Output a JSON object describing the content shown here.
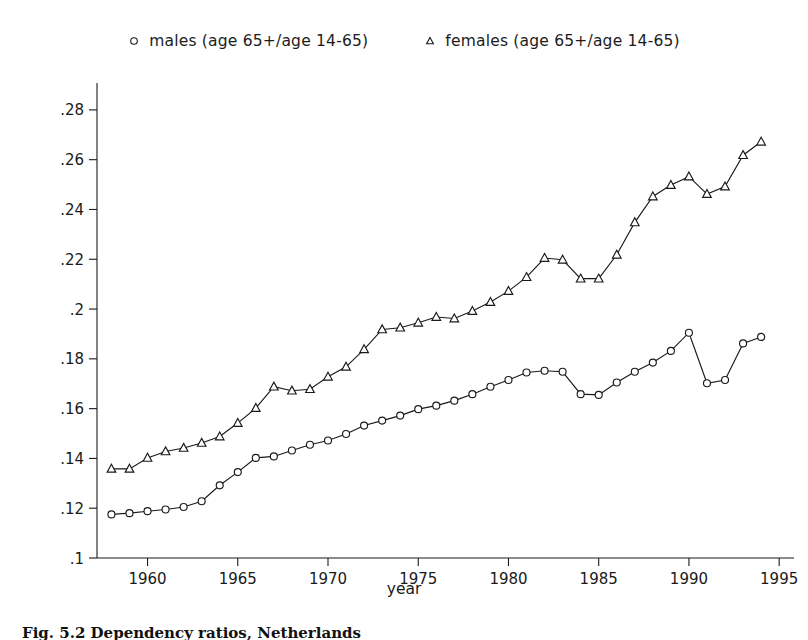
{
  "legend": {
    "entries": [
      {
        "marker": "circle-marker-icon",
        "label": "males  (age 65+/age 14-65)"
      },
      {
        "marker": "triangle-marker-icon",
        "label": "females  (age 65+/age 14-65)"
      }
    ]
  },
  "caption": {
    "text": "Fig. 5.2   Dependency ratios, Netherlands"
  },
  "chart_data": {
    "type": "line",
    "title": "",
    "xlabel": "year",
    "ylabel": "",
    "xlim": [
      1957.2,
      1995.6
    ],
    "ylim": [
      0.1,
      0.29
    ],
    "grid": false,
    "legend_position": "top",
    "xticks": [
      1960,
      1965,
      1970,
      1975,
      1980,
      1985,
      1990,
      1995
    ],
    "xticklabels": [
      "1960",
      "1965",
      "1970",
      "1975",
      "1980",
      "1985",
      "1990",
      "1995"
    ],
    "yticks": [
      0.1,
      0.12,
      0.14,
      0.16,
      0.18,
      0.2,
      0.22,
      0.24,
      0.26,
      0.28
    ],
    "yticklabels": [
      ".1",
      ".12",
      ".14",
      ".16",
      ".18",
      ".2",
      ".22",
      ".24",
      ".26",
      ".28"
    ],
    "x": [
      1958,
      1959,
      1960,
      1961,
      1962,
      1963,
      1964,
      1965,
      1966,
      1967,
      1968,
      1969,
      1970,
      1971,
      1972,
      1973,
      1974,
      1975,
      1976,
      1977,
      1978,
      1979,
      1980,
      1981,
      1982,
      1983,
      1984,
      1985,
      1986,
      1987,
      1988,
      1989,
      1990,
      1991,
      1992,
      1993,
      1994
    ],
    "series": [
      {
        "name": "males  (age 65+/age 14-65)",
        "marker": "circle",
        "values": [
          0.1175,
          0.118,
          0.1188,
          0.1195,
          0.1205,
          0.1228,
          0.1292,
          0.1345,
          0.1402,
          0.1408,
          0.1432,
          0.1455,
          0.1472,
          0.1498,
          0.1532,
          0.1552,
          0.1572,
          0.1598,
          0.1612,
          0.1632,
          0.1658,
          0.1688,
          0.1715,
          0.1745,
          0.1752,
          0.1748,
          0.1658,
          0.1655,
          0.1705,
          0.1748,
          0.1785,
          0.1832,
          0.1905,
          0.1702,
          0.1715,
          0.1862,
          0.1888
        ]
      },
      {
        "name": "females  (age 65+/age 14-65)",
        "marker": "triangle",
        "values": [
          0.1358,
          0.1358,
          0.1402,
          0.1428,
          0.1442,
          0.1462,
          0.1488,
          0.1542,
          0.1602,
          0.1688,
          0.1672,
          0.1678,
          0.1728,
          0.1768,
          0.1838,
          0.1918,
          0.1925,
          0.1945,
          0.1968,
          0.1962,
          0.1992,
          0.2028,
          0.2072,
          0.2128,
          0.2205,
          0.2198,
          0.2122,
          0.2122,
          0.2218,
          0.2348,
          0.2452,
          0.2498,
          0.2532,
          0.2462,
          0.2492,
          0.2618,
          0.2672
        ]
      }
    ]
  }
}
